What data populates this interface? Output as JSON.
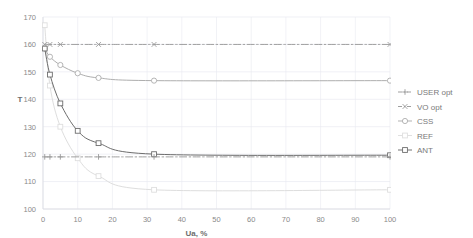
{
  "chart_data": {
    "type": "line",
    "title": "",
    "xlabel": "Ua, %",
    "ylabel": "T",
    "xlim": [
      0,
      100
    ],
    "ylim": [
      100,
      170
    ],
    "xticks": [
      0,
      10,
      20,
      30,
      40,
      50,
      60,
      70,
      80,
      90,
      100
    ],
    "yticks": [
      100,
      110,
      120,
      130,
      140,
      150,
      160,
      170
    ],
    "grid": true,
    "legend_position": "right",
    "series": [
      {
        "name": "USER opt",
        "label": "USER opt",
        "color": "#9a9a9a",
        "style": "dash-dot",
        "marker": "plus",
        "x": [
          0.5,
          2,
          5,
          16,
          32,
          100
        ],
        "values": [
          119,
          119,
          119,
          119,
          119,
          119
        ]
      },
      {
        "name": "VO opt",
        "label": "VO opt",
        "color": "#9a9a9a",
        "style": "dash-dot",
        "marker": "cross",
        "x": [
          0.5,
          2,
          5,
          16,
          32,
          100
        ],
        "values": [
          160,
          160,
          160,
          160,
          160,
          160
        ]
      },
      {
        "name": "CSS",
        "label": "CSS",
        "color": "#aeaeae",
        "style": "solid",
        "marker": "circle",
        "x": [
          0.5,
          2,
          5,
          10,
          16,
          32,
          100
        ],
        "values": [
          158.5,
          155.5,
          152.5,
          149.5,
          147.8,
          146.8,
          146.8
        ]
      },
      {
        "name": "REF",
        "label": "REF",
        "color": "#dedede",
        "style": "solid",
        "marker": "square",
        "x": [
          0.5,
          2,
          5,
          10,
          16,
          32,
          100
        ],
        "values": [
          167,
          145,
          130,
          118.5,
          112,
          107,
          107
        ]
      },
      {
        "name": "ANT",
        "label": "ANT",
        "color": "#6d6d6d",
        "style": "solid",
        "marker": "square",
        "x": [
          0.5,
          2,
          5,
          10,
          16,
          32,
          100
        ],
        "values": [
          158.5,
          149,
          138.5,
          128.5,
          124,
          120,
          119.6
        ]
      }
    ]
  },
  "axis": {
    "y_title": "T",
    "x_title": "Ua, %",
    "x_tick_labels": [
      "0",
      "10",
      "20",
      "30",
      "40",
      "50",
      "60",
      "70",
      "80",
      "90",
      "100"
    ],
    "y_tick_labels": [
      "100",
      "110",
      "120",
      "130",
      "140",
      "150",
      "160",
      "170"
    ]
  },
  "legend": {
    "items": [
      {
        "label": "USER opt"
      },
      {
        "label": "VO opt"
      },
      {
        "label": "CSS"
      },
      {
        "label": "REF"
      },
      {
        "label": "ANT"
      }
    ]
  },
  "colors": {
    "grid": "#e8eaf0",
    "axis": "#dcdee4",
    "text": "#8a8a8a"
  }
}
